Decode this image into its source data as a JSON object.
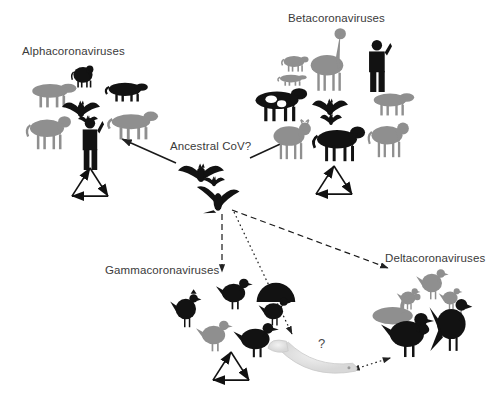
{
  "figure": {
    "type": "diagram",
    "background_color": "#ffffff",
    "text_color": "#3a3a3a"
  },
  "center": {
    "label": "Ancestral CoV?",
    "label_x": 170,
    "label_y": 140,
    "hosts": [
      {
        "name": "bat",
        "icon": "bat-icon",
        "x": 178,
        "y": 163,
        "w": 46,
        "h": 22
      },
      {
        "name": "bat-small",
        "icon": "bat-icon",
        "x": 203,
        "y": 176,
        "w": 22,
        "h": 12
      },
      {
        "name": "flying-bird",
        "icon": "bird-flying-icon",
        "x": 196,
        "y": 182,
        "w": 44,
        "h": 32
      }
    ]
  },
  "clusters": [
    {
      "id": "alpha",
      "label": "Alphacoronaviruses",
      "label_x": 22,
      "label_y": 45,
      "recombination_symbol": {
        "x": 72,
        "y": 168,
        "size": 36
      },
      "hosts": [
        {
          "name": "pig",
          "icon": "pig-icon",
          "tone": "gray",
          "x": 26,
          "y": 78,
          "w": 48,
          "h": 30
        },
        {
          "name": "cat",
          "icon": "cat-icon",
          "tone": "black",
          "x": 70,
          "y": 62,
          "w": 26,
          "h": 26
        },
        {
          "name": "ferret",
          "icon": "ferret-icon",
          "tone": "black",
          "x": 103,
          "y": 78,
          "w": 44,
          "h": 24
        },
        {
          "name": "bat",
          "icon": "bat-icon",
          "tone": "black",
          "x": 62,
          "y": 100,
          "w": 38,
          "h": 20
        },
        {
          "name": "bat-small",
          "icon": "bat-icon",
          "tone": "black",
          "x": 78,
          "y": 115,
          "w": 20,
          "h": 12
        },
        {
          "name": "dog",
          "icon": "dog-icon",
          "tone": "gray",
          "x": 24,
          "y": 112,
          "w": 46,
          "h": 38
        },
        {
          "name": "raccoon-dog",
          "icon": "raccoon-dog-icon",
          "tone": "gray",
          "x": 105,
          "y": 108,
          "w": 52,
          "h": 32
        },
        {
          "name": "human",
          "icon": "human-icon",
          "tone": "black",
          "x": 78,
          "y": 118,
          "w": 26,
          "h": 52
        }
      ]
    },
    {
      "id": "beta",
      "label": "Betacoronaviruses",
      "label_x": 288,
      "label_y": 12,
      "recombination_symbol": {
        "x": 316,
        "y": 166,
        "size": 36
      },
      "hosts": [
        {
          "name": "giraffe",
          "icon": "giraffe-icon",
          "tone": "gray",
          "x": 305,
          "y": 30,
          "w": 44,
          "h": 62
        },
        {
          "name": "mouse",
          "icon": "mouse-icon",
          "tone": "gray",
          "x": 280,
          "y": 52,
          "w": 28,
          "h": 20
        },
        {
          "name": "rat",
          "icon": "rat-icon",
          "tone": "gray",
          "x": 276,
          "y": 72,
          "w": 30,
          "h": 14
        },
        {
          "name": "human",
          "icon": "human-icon",
          "tone": "black",
          "x": 364,
          "y": 40,
          "w": 28,
          "h": 52
        },
        {
          "name": "cow",
          "icon": "cow-icon",
          "tone": "black",
          "x": 248,
          "y": 84,
          "w": 58,
          "h": 38
        },
        {
          "name": "bat",
          "icon": "bat-icon",
          "tone": "black",
          "x": 312,
          "y": 98,
          "w": 36,
          "h": 20
        },
        {
          "name": "bat-small",
          "icon": "bat-icon",
          "tone": "black",
          "x": 320,
          "y": 113,
          "w": 22,
          "h": 14
        },
        {
          "name": "pig",
          "icon": "pig-icon",
          "tone": "gray",
          "x": 368,
          "y": 88,
          "w": 44,
          "h": 28
        },
        {
          "name": "deer",
          "icon": "deer-icon",
          "tone": "gray",
          "x": 268,
          "y": 118,
          "w": 42,
          "h": 42
        },
        {
          "name": "horse",
          "icon": "horse-icon",
          "tone": "black",
          "x": 310,
          "y": 122,
          "w": 54,
          "h": 40
        },
        {
          "name": "dog",
          "icon": "dog-icon",
          "tone": "gray",
          "x": 366,
          "y": 118,
          "w": 42,
          "h": 40
        }
      ]
    },
    {
      "id": "gamma",
      "label": "Gammacoronaviruses",
      "label_x": 105,
      "label_y": 264,
      "recombination_symbol": {
        "x": 213,
        "y": 352,
        "size": 36
      },
      "hosts": [
        {
          "name": "duck",
          "icon": "duck-icon",
          "tone": "black",
          "x": 218,
          "y": 276,
          "w": 34,
          "h": 34
        },
        {
          "name": "turkey",
          "icon": "turkey-icon",
          "tone": "black",
          "x": 252,
          "y": 280,
          "w": 46,
          "h": 48
        },
        {
          "name": "rooster",
          "icon": "rooster-icon",
          "tone": "black",
          "x": 172,
          "y": 290,
          "w": 30,
          "h": 38
        },
        {
          "name": "quail",
          "icon": "quail-icon",
          "tone": "gray",
          "x": 198,
          "y": 318,
          "w": 34,
          "h": 34
        },
        {
          "name": "pheasant",
          "icon": "pheasant-icon",
          "tone": "black",
          "x": 236,
          "y": 320,
          "w": 42,
          "h": 38
        }
      ]
    },
    {
      "id": "delta",
      "label": "Deltacoronaviruses",
      "label_x": 385,
      "label_y": 252,
      "recombination_symbol": null,
      "hosts": [
        {
          "name": "songbird",
          "icon": "songbird-icon",
          "tone": "gray",
          "x": 418,
          "y": 266,
          "w": 30,
          "h": 34
        },
        {
          "name": "small-bird",
          "icon": "small-bird-icon",
          "tone": "gray",
          "x": 398,
          "y": 286,
          "w": 22,
          "h": 24
        },
        {
          "name": "perched-bird",
          "icon": "perched-bird-icon",
          "tone": "gray",
          "x": 440,
          "y": 286,
          "w": 22,
          "h": 24
        },
        {
          "name": "swan",
          "icon": "swan-icon",
          "tone": "gray",
          "x": 368,
          "y": 292,
          "w": 56,
          "h": 36
        },
        {
          "name": "pelican",
          "icon": "pelican-icon",
          "tone": "black",
          "x": 384,
          "y": 310,
          "w": 50,
          "h": 48
        },
        {
          "name": "parrot",
          "icon": "parrot-icon",
          "tone": "black",
          "x": 432,
          "y": 296,
          "w": 42,
          "h": 56
        }
      ]
    }
  ],
  "unknown_host": {
    "name": "whale",
    "icon": "whale-icon",
    "label": "?",
    "label_x": 318,
    "label_y": 342,
    "x": 268,
    "y": 336,
    "w": 92,
    "h": 44
  },
  "arrows": [
    {
      "id": "ancestral-to-alpha",
      "style": "solid",
      "from": [
        176,
        163
      ],
      "to": [
        122,
        139
      ],
      "bidirectional": false
    },
    {
      "id": "ancestral-to-beta",
      "style": "solid",
      "from": [
        250,
        158
      ],
      "to": [
        302,
        134
      ],
      "bidirectional": false
    },
    {
      "id": "ancestral-to-gamma",
      "style": "dashed",
      "from": [
        222,
        214
      ],
      "to": [
        222,
        272
      ],
      "bidirectional": false
    },
    {
      "id": "ancestral-to-delta",
      "style": "dashed",
      "from": [
        232,
        210
      ],
      "to": [
        388,
        268
      ],
      "bidirectional": false
    },
    {
      "id": "ancestral-to-whale",
      "style": "dotted",
      "from": [
        234,
        212
      ],
      "to": [
        292,
        334
      ],
      "bidirectional": false
    },
    {
      "id": "delta-to-whale",
      "style": "dotted",
      "from": [
        390,
        358
      ],
      "to": [
        352,
        370
      ],
      "bidirectional": true
    }
  ]
}
